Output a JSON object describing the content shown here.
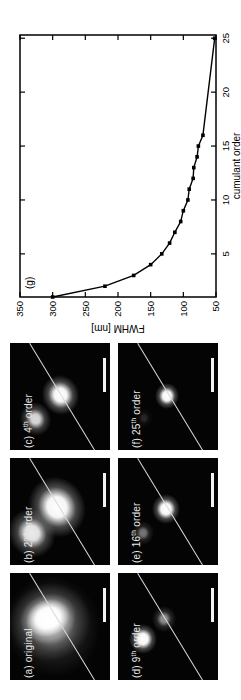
{
  "colors": {
    "background": "#ffffff",
    "panel_background": "#040404",
    "ink": "#000000",
    "panel_label_text": "#e9e9e9",
    "profile_line": "#d9d9d9",
    "scalebar": "#f2f2f2"
  },
  "panels": [
    {
      "id": "a",
      "label_pre": "(a) original",
      "label_sup": "",
      "label_post": "",
      "spots": [
        {
          "cx": 54,
          "cy": 43,
          "w": 102,
          "h": 94,
          "rot": -15,
          "a": 0.4,
          "s1": 10,
          "s2": 52
        },
        {
          "cx": 58,
          "cy": 40,
          "w": 78,
          "h": 82,
          "rot": -20,
          "a": 0.75,
          "s1": 22,
          "s2": 60
        },
        {
          "cx": 62,
          "cy": 38,
          "w": 48,
          "h": 58,
          "rot": -20,
          "a": 1.0,
          "s1": 42,
          "s2": 78
        }
      ]
    },
    {
      "id": "b",
      "label_pre": "(b) 2",
      "label_sup": "nd",
      "label_post": " order",
      "spots": [
        {
          "cx": 32,
          "cy": 22,
          "w": 50,
          "h": 46,
          "rot": -30,
          "a": 0.92,
          "s1": 30,
          "s2": 62
        },
        {
          "cx": 58,
          "cy": 47,
          "w": 62,
          "h": 56,
          "rot": -30,
          "a": 1.0,
          "s1": 34,
          "s2": 66
        }
      ]
    },
    {
      "id": "c",
      "label_pre": "(c) 4",
      "label_sup": "th",
      "label_post": " order",
      "spots": [
        {
          "cx": 31,
          "cy": 25,
          "w": 34,
          "h": 31,
          "rot": -20,
          "a": 0.85,
          "s1": 28,
          "s2": 60
        },
        {
          "cx": 55,
          "cy": 50,
          "w": 40,
          "h": 37,
          "rot": -20,
          "a": 1.0,
          "s1": 34,
          "s2": 66
        }
      ]
    },
    {
      "id": "d",
      "label_pre": "(d) 9",
      "label_sup": "th",
      "label_post": " order",
      "spots": [
        {
          "cx": 61,
          "cy": 46,
          "w": 26,
          "h": 24,
          "rot": 0,
          "a": 0.55,
          "s1": 26,
          "s2": 58
        },
        {
          "cx": 41,
          "cy": 25,
          "w": 30,
          "h": 28,
          "rot": 0,
          "a": 1.0,
          "s1": 36,
          "s2": 66
        }
      ]
    },
    {
      "id": "e",
      "label_pre": "(e) 16",
      "label_sup": "th",
      "label_post": " order",
      "spots": [
        {
          "cx": 32,
          "cy": 25,
          "w": 24,
          "h": 22,
          "rot": 0,
          "a": 0.45,
          "s1": 26,
          "s2": 56
        },
        {
          "cx": 56,
          "cy": 48,
          "w": 30,
          "h": 28,
          "rot": 0,
          "a": 1.0,
          "s1": 36,
          "s2": 66
        }
      ]
    },
    {
      "id": "f",
      "label_pre": "(f) 25",
      "label_sup": "th",
      "label_post": " order",
      "spots": [
        {
          "cx": 32,
          "cy": 26,
          "w": 20,
          "h": 18,
          "rot": 0,
          "a": 0.14,
          "s1": 24,
          "s2": 52
        },
        {
          "cx": 54,
          "cy": 49,
          "w": 26,
          "h": 24,
          "rot": 0,
          "a": 1.0,
          "s1": 36,
          "s2": 66
        }
      ]
    }
  ],
  "panel_overlay": {
    "line": {
      "x1": 0,
      "y1": 85,
      "x2": 107,
      "y2": 20
    },
    "scalebar": {
      "x": 58,
      "y": 93,
      "w": 34,
      "h": 3
    }
  },
  "chart_data": {
    "type": "scatter",
    "panel_label": "(g)",
    "title": "",
    "xlabel": "cumulant order",
    "ylabel": "FWHM [nm]",
    "xlim": [
      1,
      25.3
    ],
    "ylim": [
      50,
      350
    ],
    "xticks": [
      5,
      10,
      15,
      20,
      25
    ],
    "yticks": [
      50,
      100,
      150,
      200,
      250,
      300,
      350
    ],
    "grid": false,
    "legend_position": "none",
    "series": [
      {
        "name": "FWHM vs cumulant order",
        "marker": "filled-square",
        "x": [
          1,
          2,
          3,
          4,
          5,
          6,
          7,
          8,
          9,
          10,
          11,
          12,
          13,
          14,
          15,
          16,
          25
        ],
        "y": [
          300,
          220,
          176,
          150,
          133,
          121,
          113,
          104,
          100,
          93,
          91,
          85,
          84,
          79,
          77,
          70,
          52
        ]
      }
    ],
    "fit_line": "solid line through data points"
  }
}
